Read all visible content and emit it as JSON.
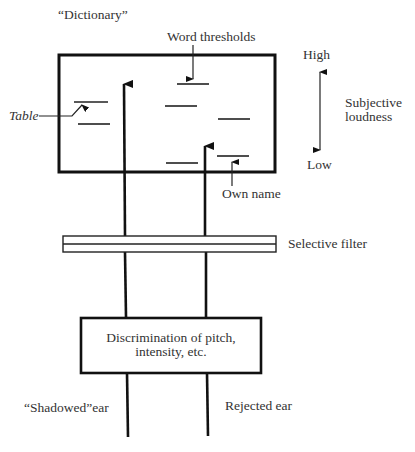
{
  "diagram": {
    "title_label": "“Dictionary”",
    "word_thresholds_label": "Word thresholds",
    "table_label": "Table",
    "own_name_label": "Own name",
    "scale": {
      "high_label": "High",
      "low_label": "Low",
      "axis_label_line1": "Subjective",
      "axis_label_line2": "loudness"
    },
    "filter_label": "Selective filter",
    "discrimination_box": {
      "line1": "Discrimination of pitch,",
      "line2": "intensity, etc."
    },
    "shadowed_ear_label": "“Shadowed”ear",
    "rejected_ear_label": "Rejected ear"
  }
}
